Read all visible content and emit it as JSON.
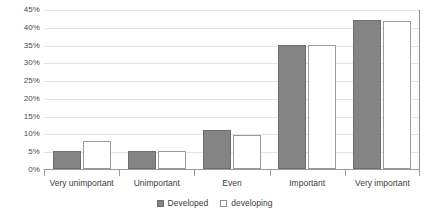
{
  "chart_data": {
    "type": "bar",
    "title": "",
    "subtitle": "",
    "xlabel": "",
    "ylabel": "",
    "categories": [
      "Very unimportant",
      "Unimportant",
      "Even",
      "Important",
      "Very important"
    ],
    "series": [
      {
        "name": "Developed",
        "values": [
          5,
          5,
          11,
          35,
          42
        ],
        "color": "#848484",
        "fill": "solid"
      },
      {
        "name": "developing",
        "values": [
          8,
          5,
          9.5,
          35,
          41.5
        ],
        "color": "#ffffff",
        "fill": "outline"
      }
    ],
    "ylim": [
      0,
      45
    ],
    "ytick_step": 5,
    "ytick_labels": [
      "0%",
      "5%",
      "10%",
      "15%",
      "20%",
      "25%",
      "30%",
      "35%",
      "40%",
      "45%"
    ],
    "ytick_values": [
      0,
      5,
      10,
      15,
      20,
      25,
      30,
      35,
      40,
      45
    ],
    "grid": true,
    "grid_axis": "y",
    "legend_position": "bottom",
    "value_suffix": "%"
  },
  "legend": {
    "entries": [
      {
        "label": "Developed"
      },
      {
        "label": "developing"
      }
    ]
  }
}
